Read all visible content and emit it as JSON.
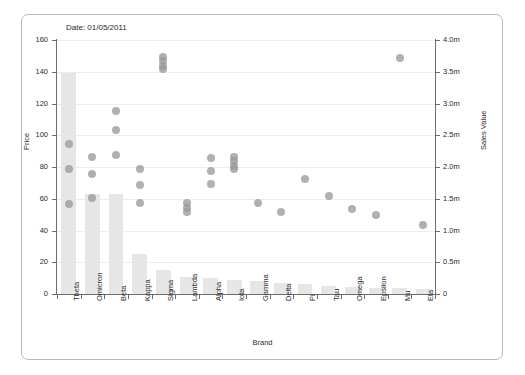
{
  "annotations": {
    "date_label": "Date: 01/05/2011"
  },
  "chart_data": {
    "type": "bar",
    "title": "",
    "xlabel": "Brand",
    "ylabel": "Price",
    "y2label": "Sales Value",
    "ylim": [
      0,
      160
    ],
    "y2lim": [
      0,
      4000000
    ],
    "grid": true,
    "legend": false,
    "yticks": [
      "0",
      "20",
      "40",
      "60",
      "80",
      "100",
      "120",
      "140",
      "160"
    ],
    "ytickvalues": [
      0,
      20,
      40,
      60,
      80,
      100,
      120,
      140,
      160
    ],
    "y2ticks": [
      "0",
      "0.5m",
      "1.0m",
      "1.5m",
      "2.0m",
      "2.5m",
      "3.0m",
      "3.5m",
      "4.0m"
    ],
    "y2tickvalues": [
      0,
      500000,
      1000000,
      1500000,
      2000000,
      2500000,
      3000000,
      3500000,
      4000000
    ],
    "categories": [
      "Theta",
      "Omicron",
      "Beta",
      "Kappa",
      "Sigma",
      "Lambda",
      "Alpha",
      "Iota",
      "Gamma",
      "Delta",
      "Pi",
      "Tau",
      "Omega",
      "Epsilon",
      "Mu",
      "Eta"
    ],
    "series": [
      {
        "name": "Price",
        "type": "bar",
        "axis": "left",
        "values": [
          139,
          63,
          63,
          25,
          15,
          11,
          10,
          9,
          8,
          7,
          6,
          5,
          4.5,
          4,
          3.5,
          3
        ]
      },
      {
        "name": "Sales Value",
        "type": "scatter",
        "axis": "right",
        "points": [
          {
            "category": "Theta",
            "values": [
              97,
              81,
              59
            ]
          },
          {
            "category": "Omicron",
            "values": [
              89,
              78,
              63
            ]
          },
          {
            "category": "Beta",
            "values": [
              118,
              106,
              90
            ]
          },
          {
            "category": "Kappa",
            "values": [
              81,
              71,
              60
            ]
          },
          {
            "category": "Sigma",
            "values": [
              152,
              149,
              146,
              144
            ]
          },
          {
            "category": "Lambda",
            "values": [
              60,
              57,
              54
            ]
          },
          {
            "category": "Alpha",
            "values": [
              88,
              80,
              72
            ]
          },
          {
            "category": "Iota",
            "values": [
              89,
              86,
              83,
              81
            ]
          },
          {
            "category": "Gamma",
            "values": [
              60
            ]
          },
          {
            "category": "Delta",
            "values": [
              54
            ]
          },
          {
            "category": "Pi",
            "values": [
              75
            ]
          },
          {
            "category": "Tau",
            "values": [
              64
            ]
          },
          {
            "category": "Omega",
            "values": [
              56
            ]
          },
          {
            "category": "Epsilon",
            "values": [
              52
            ]
          },
          {
            "category": "Mu",
            "values": [
              151
            ]
          },
          {
            "category": "Eta",
            "values": [
              46
            ]
          }
        ]
      }
    ],
    "colors": {
      "bar": "#e6e6e6",
      "point": "#9a9a9a",
      "axis": "#6e6e6e",
      "grid": "#ededed",
      "text": "#2b2b2b"
    }
  }
}
